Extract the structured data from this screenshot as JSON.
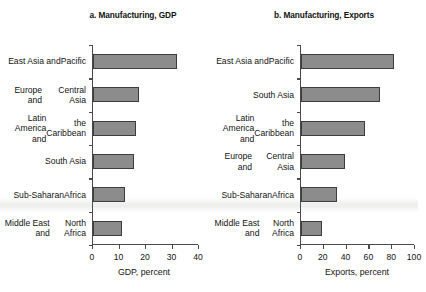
{
  "chart_data": [
    {
      "type": "bar",
      "orientation": "horizontal",
      "title": "a. Manufacturing, GDP",
      "xlabel": "GDP, percent",
      "ylabel": "",
      "xlim": [
        0,
        40
      ],
      "xticks": [
        0,
        10,
        20,
        30,
        40
      ],
      "grid": false,
      "legend": "none",
      "categories": [
        "East Asia and Pacific",
        "Europe and Central Asia",
        "Latin America and the Caribbean",
        "South Asia",
        "Sub-Saharan Africa",
        "Middle East and North Africa"
      ],
      "category_lines": [
        [
          "East Asia and",
          "Pacific"
        ],
        [
          "Europe and",
          "Central Asia"
        ],
        [
          "Latin America and",
          "the Caribbean"
        ],
        [
          "South Asia"
        ],
        [
          "Sub-Saharan",
          "Africa"
        ],
        [
          "Middle East and",
          "North Africa"
        ]
      ],
      "values": [
        32,
        17.5,
        16.5,
        15.5,
        12,
        11
      ]
    },
    {
      "type": "bar",
      "orientation": "horizontal",
      "title": "b. Manufacturing, Exports",
      "xlabel": "Exports, percent",
      "ylabel": "",
      "xlim": [
        0,
        100
      ],
      "xticks": [
        0,
        20,
        40,
        60,
        80,
        100
      ],
      "grid": false,
      "legend": "none",
      "categories": [
        "East Asia and Pacific",
        "South Asia",
        "Latin America and the Caribbean",
        "Europe and Central Asia",
        "Sub-Saharan Africa",
        "Middle East and North Africa"
      ],
      "category_lines": [
        [
          "East Asia and",
          "Pacific"
        ],
        [
          "South Asia"
        ],
        [
          "Latin America and",
          "the Caribbean"
        ],
        [
          "Europe and",
          "Central Asia"
        ],
        [
          "Sub-Saharan",
          "Africa"
        ],
        [
          "Middle East and",
          "North Africa"
        ]
      ],
      "values": [
        82,
        70,
        57,
        39,
        32,
        19
      ]
    }
  ],
  "style": {
    "bar_fill": "#8c8c8c",
    "bar_stroke": "#3c3c3c",
    "axis_color": "#4a4a4a",
    "text_color": "#141414",
    "background": "#ffffff"
  }
}
